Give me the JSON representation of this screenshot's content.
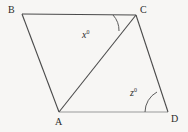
{
  "figure": {
    "kind": "geometry-diagram",
    "shape": "parallelogram-with-diagonal",
    "background_color": "#f7f6f4",
    "stroke_color": "#3a3a3a",
    "light_stroke_color": "#8d8d8d",
    "text_color": "#2b2b2b"
  },
  "vertices": {
    "B": {
      "label": "B",
      "x": 22,
      "y": 14
    },
    "C": {
      "label": "C",
      "x": 136,
      "y": 15
    },
    "A": {
      "label": "A",
      "x": 59,
      "y": 112
    },
    "D": {
      "label": "D",
      "x": 168,
      "y": 112
    }
  },
  "segments": [
    {
      "name": "BC",
      "from": "B",
      "to": "C",
      "tone": "dark"
    },
    {
      "name": "BA",
      "from": "B",
      "to": "A",
      "tone": "dark"
    },
    {
      "name": "AD",
      "from": "A",
      "to": "D",
      "tone": "light"
    },
    {
      "name": "CD",
      "from": "C",
      "to": "D",
      "tone": "dark"
    },
    {
      "name": "AC",
      "from": "A",
      "to": "C",
      "tone": "dark"
    }
  ],
  "angles": [
    {
      "name": "angle-x",
      "variable": "x",
      "degree_symbol": "0",
      "at_vertex": "C",
      "between": [
        "CB",
        "CA"
      ],
      "arc_path": "M 113 15 A 23 23 0 0 1 119 31"
    },
    {
      "name": "angle-z",
      "variable": "z",
      "degree_symbol": "0",
      "at_vertex": "D",
      "between": [
        "DA",
        "DC"
      ],
      "arc_path": "M 145 112 A 23 23 0 0 1 157 92"
    }
  ]
}
